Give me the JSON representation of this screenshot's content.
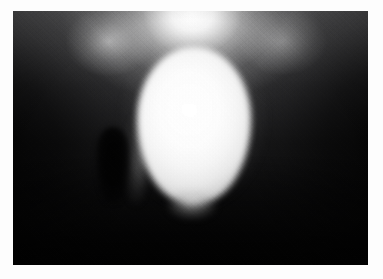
{
  "document": {
    "type": "medical-radiograph",
    "modality": "X-ray",
    "study": "Cystogram",
    "view": "Anteroposterior (AP)",
    "caption": ""
  },
  "frame": {
    "background_color": "#fdfdfd",
    "margin_left_px": 13,
    "margin_top_px": 11,
    "margin_right_px": 15,
    "margin_bottom_px": 14
  },
  "plate": {
    "width_px": 355,
    "height_px": 254,
    "base_color": "#0a0a0a",
    "background_description": "Dark radiolucent soft tissue with lighter band across the upper portion and deep black shadows at the left and right flanks and along the lower margin."
  },
  "features": {
    "bladder": {
      "label": "Contrast-filled urinary bladder",
      "shape": "oval",
      "fill_color": "#ffffff",
      "edge_color": "#a6a6a6",
      "center_x_pct": 51,
      "center_y_pct": 45,
      "width_pct": 32,
      "height_pct": 62
    },
    "superior_band": {
      "label": "Bright midline soft-tissue band superior to bladder",
      "color": "#fafafa",
      "center_x_pct": 50,
      "center_y_pct": 2
    },
    "catheter_shadow": {
      "label": "Dark tubular finger-like structure left of bladder",
      "color": "#000000",
      "center_x_pct": 28,
      "center_y_pct": 60
    },
    "bladder_neck": {
      "label": "Bladder base / neck region",
      "color": "#8c8c8c",
      "center_x_pct": 50,
      "center_y_pct": 77
    },
    "left_flank": {
      "label": "Left pelvic soft-tissue shadow",
      "color": "#070707"
    },
    "right_flank": {
      "label": "Right pelvic soft-tissue shadow",
      "color": "#060606"
    },
    "inferior_shadow": {
      "label": "Inferior pelvic shadow",
      "color": "#050505"
    }
  },
  "grain": {
    "label": "Film grain / scan noise",
    "opacity": 0.3
  }
}
